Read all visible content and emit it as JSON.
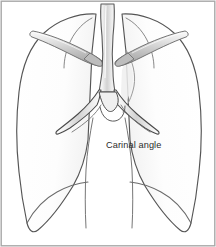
{
  "figure": {
    "view": "anterior frontal view of thoracic cavity",
    "background_color": "#ffffff",
    "border_color": "#9a9a9a",
    "outline_color": "#4a4a4a",
    "lung_fill_color": "#fcfcfc",
    "airway_fill_color": "#e8e8e8",
    "bone_fill_color": "#ededed",
    "shading_color": "#b8b8b8"
  },
  "labels": {
    "carinal_angle": "Carinal angle"
  },
  "structures": {
    "trachea": "trachea",
    "carina": "carina",
    "left_main_bronchus": "left main bronchus",
    "right_main_bronchus": "right main bronchus",
    "left_lung": "left lung",
    "right_lung": "right lung",
    "left_clavicle": "left clavicle",
    "right_clavicle": "right clavicle"
  }
}
